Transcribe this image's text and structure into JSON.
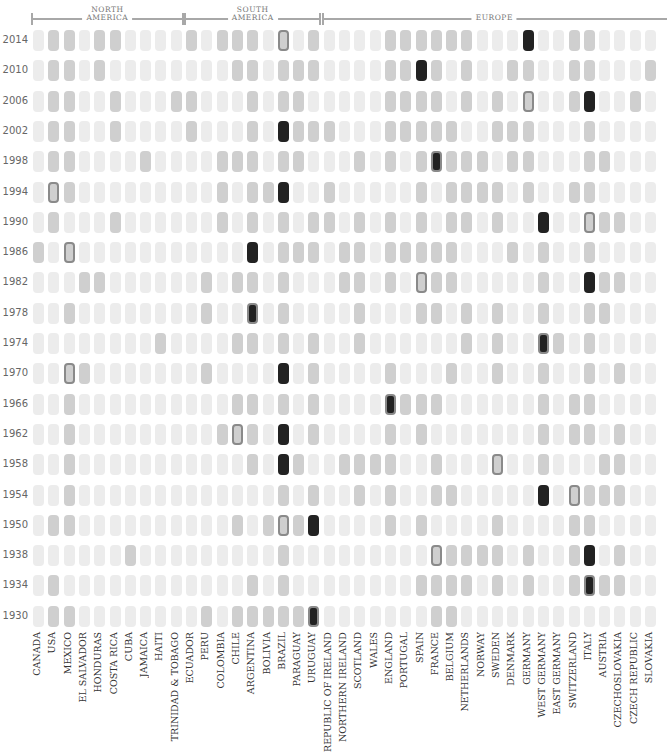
{
  "chart_data": {
    "type": "heatmap",
    "title": "",
    "legend": {
      "0": "did not participate",
      "1": "participated",
      "2": "winner",
      "host": "outlined cell = host nation"
    },
    "regions": [
      {
        "label": "NORTH\nAMERICA",
        "from_col": 0,
        "to_col": 9
      },
      {
        "label": "SOUTH\nAMERICA",
        "from_col": 10,
        "to_col": 18
      },
      {
        "label": "EUROPE",
        "from_col": 19,
        "to_col": 40
      }
    ],
    "countries": [
      "CANADA",
      "USA",
      "MEXICO",
      "EL SALVADOR",
      "HONDURAS",
      "COSTA RICA",
      "CUBA",
      "JAMAICA",
      "HAITI",
      "TRINIDAD & TOBAGO",
      "ECUADOR",
      "PERU",
      "COLOMBIA",
      "CHILE",
      "ARGENTINA",
      "BOLIVIA",
      "BRAZIL",
      "PARAGUAY",
      "URUGUAY",
      "REPUBLIC OF IRELAND",
      "NORTHERN IRELAND",
      "SCOTLAND",
      "WALES",
      "ENGLAND",
      "PORTUGAL",
      "SPAIN",
      "FRANCE",
      "BELGIUM",
      "NETHERLANDS",
      "NORWAY",
      "SWEDEN",
      "DENMARK",
      "GERMANY",
      "WEST GERMANY",
      "EAST GERMANY",
      "SWITZERLAND",
      "ITALY",
      "AUSTRIA",
      "CZECHOSLOVAKIA",
      "CZECH REPUBLIC",
      "SLOVAKIA"
    ],
    "years": [
      "2014",
      "2010",
      "2006",
      "2002",
      "1998",
      "1994",
      "1990",
      "1986",
      "1982",
      "1978",
      "1974",
      "1970",
      "1966",
      "1962",
      "1958",
      "1954",
      "1950",
      "1938",
      "1934",
      "1930"
    ],
    "rows": {
      "2014": {
        "participated": [
          "USA",
          "MEXICO",
          "HONDURAS",
          "COSTA RICA",
          "ECUADOR",
          "COLOMBIA",
          "CHILE",
          "ARGENTINA",
          "BRAZIL",
          "URUGUAY",
          "ENGLAND",
          "PORTUGAL",
          "SPAIN",
          "FRANCE",
          "BELGIUM",
          "NETHERLANDS",
          "GERMANY",
          "SWITZERLAND",
          "ITALY"
        ],
        "winner": "GERMANY",
        "host": "BRAZIL"
      },
      "2010": {
        "participated": [
          "USA",
          "MEXICO",
          "HONDURAS",
          "CHILE",
          "ARGENTINA",
          "BRAZIL",
          "PARAGUAY",
          "URUGUAY",
          "ENGLAND",
          "PORTUGAL",
          "SPAIN",
          "FRANCE",
          "NETHERLANDS",
          "DENMARK",
          "GERMANY",
          "SWITZERLAND",
          "ITALY",
          "SLOVAKIA"
        ],
        "winner": "SPAIN",
        "host": null
      },
      "2006": {
        "participated": [
          "USA",
          "MEXICO",
          "COSTA RICA",
          "TRINIDAD & TOBAGO",
          "ECUADOR",
          "ARGENTINA",
          "BRAZIL",
          "PARAGUAY",
          "ENGLAND",
          "PORTUGAL",
          "SPAIN",
          "FRANCE",
          "NETHERLANDS",
          "SWEDEN",
          "GERMANY",
          "SWITZERLAND",
          "ITALY",
          "CZECH REPUBLIC"
        ],
        "winner": "ITALY",
        "host": "GERMANY"
      },
      "2002": {
        "participated": [
          "USA",
          "MEXICO",
          "COSTA RICA",
          "ECUADOR",
          "ARGENTINA",
          "BRAZIL",
          "PARAGUAY",
          "URUGUAY",
          "REPUBLIC OF IRELAND",
          "ENGLAND",
          "PORTUGAL",
          "SPAIN",
          "FRANCE",
          "BELGIUM",
          "SWEDEN",
          "DENMARK",
          "GERMANY",
          "ITALY"
        ],
        "winner": "BRAZIL",
        "host": null
      },
      "1998": {
        "participated": [
          "USA",
          "MEXICO",
          "JAMAICA",
          "COLOMBIA",
          "CHILE",
          "ARGENTINA",
          "BRAZIL",
          "PARAGUAY",
          "SCOTLAND",
          "ENGLAND",
          "SPAIN",
          "FRANCE",
          "BELGIUM",
          "NETHERLANDS",
          "NORWAY",
          "DENMARK",
          "GERMANY",
          "ITALY",
          "AUSTRIA"
        ],
        "winner": "FRANCE",
        "host": "FRANCE"
      },
      "1994": {
        "participated": [
          "USA",
          "MEXICO",
          "COLOMBIA",
          "ARGENTINA",
          "BOLIVIA",
          "BRAZIL",
          "REPUBLIC OF IRELAND",
          "SPAIN",
          "BELGIUM",
          "NETHERLANDS",
          "NORWAY",
          "SWEDEN",
          "GERMANY",
          "SWITZERLAND",
          "ITALY"
        ],
        "winner": "BRAZIL",
        "host": "USA"
      },
      "1990": {
        "participated": [
          "USA",
          "COSTA RICA",
          "COLOMBIA",
          "ARGENTINA",
          "BRAZIL",
          "URUGUAY",
          "REPUBLIC OF IRELAND",
          "SCOTLAND",
          "ENGLAND",
          "SPAIN",
          "BELGIUM",
          "NETHERLANDS",
          "SWEDEN",
          "WEST GERMANY",
          "ITALY",
          "AUSTRIA",
          "CZECHOSLOVAKIA"
        ],
        "winner": "WEST GERMANY",
        "host": "ITALY"
      },
      "1986": {
        "participated": [
          "CANADA",
          "MEXICO",
          "PARAGUAY",
          "ARGENTINA",
          "BRAZIL",
          "URUGUAY",
          "NORTHERN IRELAND",
          "SCOTLAND",
          "ENGLAND",
          "PORTUGAL",
          "SPAIN",
          "FRANCE",
          "BELGIUM",
          "DENMARK",
          "WEST GERMANY",
          "ITALY"
        ],
        "winner": "ARGENTINA",
        "host": "MEXICO"
      },
      "1982": {
        "participated": [
          "EL SALVADOR",
          "HONDURAS",
          "PERU",
          "CHILE",
          "ARGENTINA",
          "BRAZIL",
          "NORTHERN IRELAND",
          "SCOTLAND",
          "ENGLAND",
          "SPAIN",
          "FRANCE",
          "BELGIUM",
          "WEST GERMANY",
          "ITALY",
          "AUSTRIA",
          "CZECHOSLOVAKIA"
        ],
        "winner": "ITALY",
        "host": "SPAIN"
      },
      "1978": {
        "participated": [
          "MEXICO",
          "PERU",
          "ARGENTINA",
          "BRAZIL",
          "SCOTLAND",
          "SPAIN",
          "FRANCE",
          "NETHERLANDS",
          "SWEDEN",
          "WEST GERMANY",
          "ITALY",
          "AUSTRIA"
        ],
        "winner": "ARGENTINA",
        "host": "ARGENTINA"
      },
      "1974": {
        "participated": [
          "HAITI",
          "CHILE",
          "ARGENTINA",
          "BRAZIL",
          "URUGUAY",
          "SCOTLAND",
          "NETHERLANDS",
          "SWEDEN",
          "WEST GERMANY",
          "EAST GERMANY",
          "ITALY"
        ],
        "winner": "WEST GERMANY",
        "host": "WEST GERMANY"
      },
      "1970": {
        "participated": [
          "MEXICO",
          "EL SALVADOR",
          "PERU",
          "BRAZIL",
          "URUGUAY",
          "ENGLAND",
          "BELGIUM",
          "SWEDEN",
          "WEST GERMANY",
          "ITALY",
          "CZECHOSLOVAKIA"
        ],
        "winner": "BRAZIL",
        "host": "MEXICO"
      },
      "1966": {
        "participated": [
          "MEXICO",
          "CHILE",
          "ARGENTINA",
          "BRAZIL",
          "URUGUAY",
          "ENGLAND",
          "PORTUGAL",
          "SPAIN",
          "FRANCE",
          "WEST GERMANY",
          "SWITZERLAND",
          "ITALY"
        ],
        "winner": "ENGLAND",
        "host": "ENGLAND"
      },
      "1962": {
        "participated": [
          "MEXICO",
          "COLOMBIA",
          "CHILE",
          "ARGENTINA",
          "BRAZIL",
          "URUGUAY",
          "ENGLAND",
          "SPAIN",
          "WEST GERMANY",
          "SWITZERLAND",
          "ITALY",
          "CZECHOSLOVAKIA"
        ],
        "winner": "BRAZIL",
        "host": "CHILE"
      },
      "1958": {
        "participated": [
          "MEXICO",
          "ARGENTINA",
          "BRAZIL",
          "PARAGUAY",
          "NORTHERN IRELAND",
          "SCOTLAND",
          "WALES",
          "ENGLAND",
          "FRANCE",
          "SWEDEN",
          "WEST GERMANY",
          "AUSTRIA",
          "CZECHOSLOVAKIA"
        ],
        "winner": "BRAZIL",
        "host": "SWEDEN"
      },
      "1954": {
        "participated": [
          "MEXICO",
          "BRAZIL",
          "URUGUAY",
          "SCOTLAND",
          "ENGLAND",
          "FRANCE",
          "BELGIUM",
          "WEST GERMANY",
          "SWITZERLAND",
          "ITALY",
          "AUSTRIA",
          "CZECHOSLOVAKIA"
        ],
        "winner": "WEST GERMANY",
        "host": "SWITZERLAND"
      },
      "1950": {
        "participated": [
          "USA",
          "MEXICO",
          "CHILE",
          "BOLIVIA",
          "BRAZIL",
          "PARAGUAY",
          "URUGUAY",
          "ENGLAND",
          "SPAIN",
          "SWEDEN",
          "SWITZERLAND",
          "ITALY"
        ],
        "winner": "URUGUAY",
        "host": "BRAZIL"
      },
      "1938": {
        "participated": [
          "CUBA",
          "BRAZIL",
          "FRANCE",
          "BELGIUM",
          "NETHERLANDS",
          "NORWAY",
          "SWEDEN",
          "GERMANY",
          "SWITZERLAND",
          "ITALY",
          "CZECHOSLOVAKIA"
        ],
        "winner": "ITALY",
        "host": "FRANCE"
      },
      "1934": {
        "participated": [
          "USA",
          "ARGENTINA",
          "BRAZIL",
          "SPAIN",
          "FRANCE",
          "BELGIUM",
          "NETHERLANDS",
          "SWEDEN",
          "GERMANY",
          "SWITZERLAND",
          "ITALY",
          "AUSTRIA",
          "CZECHOSLOVAKIA"
        ],
        "winner": "ITALY",
        "host": "ITALY"
      },
      "1930": {
        "participated": [
          "USA",
          "MEXICO",
          "PERU",
          "CHILE",
          "ARGENTINA",
          "BOLIVIA",
          "BRAZIL",
          "PARAGUAY",
          "URUGUAY",
          "FRANCE",
          "BELGIUM"
        ],
        "winner": "URUGUAY",
        "host": "URUGUAY"
      }
    },
    "colors": {
      "none": "#ececec",
      "participated": "#cfcfcf",
      "winner": "#222222",
      "host_outline": "#8a8a8a"
    }
  }
}
